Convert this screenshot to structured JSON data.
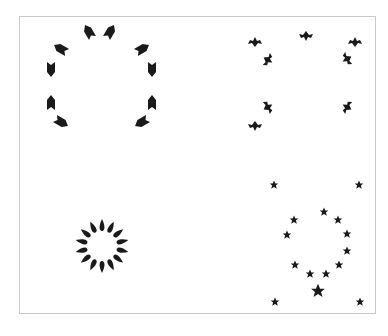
{
  "figure": {
    "frame_color": "#c8c8c8",
    "mark_color": "#1a1a1a",
    "panels": [
      {
        "id": "top-left",
        "shape": "arrow-tag",
        "marks": [
          {
            "x": 89,
            "y": 32,
            "rot": -120
          },
          {
            "x": 110,
            "y": 32,
            "rot": -60
          },
          {
            "x": 61,
            "y": 49,
            "rot": -150
          },
          {
            "x": 142,
            "y": 49,
            "rot": -30
          },
          {
            "x": 51,
            "y": 69,
            "rot": 90
          },
          {
            "x": 152,
            "y": 69,
            "rot": 90
          },
          {
            "x": 51,
            "y": 103,
            "rot": -90
          },
          {
            "x": 152,
            "y": 103,
            "rot": -90
          },
          {
            "x": 61,
            "y": 122,
            "rot": 30
          },
          {
            "x": 142,
            "y": 122,
            "rot": 150
          }
        ]
      },
      {
        "id": "top-right",
        "shape": "bird",
        "marks": [
          {
            "x": 255,
            "y": 42,
            "rot": 180
          },
          {
            "x": 306,
            "y": 36,
            "rot": 0
          },
          {
            "x": 355,
            "y": 42,
            "rot": 180
          },
          {
            "x": 268,
            "y": 60,
            "rot": -60
          },
          {
            "x": 347,
            "y": 59,
            "rot": 60
          },
          {
            "x": 268,
            "y": 107,
            "rot": -120
          },
          {
            "x": 347,
            "y": 107,
            "rot": 120
          },
          {
            "x": 255,
            "y": 126,
            "rot": 0
          }
        ]
      },
      {
        "id": "bottom-left",
        "shape": "petal-ring",
        "center": {
          "x": 102,
          "y": 246
        },
        "radius": 22,
        "count": 14
      },
      {
        "id": "bottom-right",
        "shape": "star",
        "marks": [
          {
            "x": 274,
            "y": 185,
            "s": 1
          },
          {
            "x": 359,
            "y": 185,
            "s": 1
          },
          {
            "x": 294,
            "y": 220,
            "s": 1
          },
          {
            "x": 324,
            "y": 212,
            "s": 1
          },
          {
            "x": 338,
            "y": 220,
            "s": 1
          },
          {
            "x": 287,
            "y": 235,
            "s": 1
          },
          {
            "x": 347,
            "y": 234,
            "s": 1
          },
          {
            "x": 347,
            "y": 251,
            "s": 1
          },
          {
            "x": 295,
            "y": 265,
            "s": 1
          },
          {
            "x": 339,
            "y": 265,
            "s": 1
          },
          {
            "x": 310,
            "y": 274,
            "s": 1
          },
          {
            "x": 326,
            "y": 274,
            "s": 1
          },
          {
            "x": 318,
            "y": 291,
            "s": 1.6
          },
          {
            "x": 275,
            "y": 302,
            "s": 1
          },
          {
            "x": 360,
            "y": 302,
            "s": 1
          }
        ]
      }
    ]
  }
}
